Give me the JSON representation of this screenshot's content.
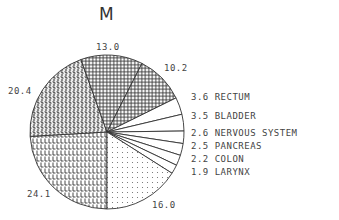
{
  "chart_data": {
    "type": "pie",
    "title": "M",
    "slices": [
      {
        "label": "",
        "value": 24.1,
        "pattern": "L"
      },
      {
        "label": "",
        "value": 20.4,
        "pattern": "S"
      },
      {
        "label": "",
        "value": 13.0,
        "pattern": "cross"
      },
      {
        "label": "",
        "value": 10.2,
        "pattern": "cross"
      },
      {
        "label": "RECTUM",
        "value": 3.6,
        "pattern": "none"
      },
      {
        "label": "BLADDER",
        "value": 3.5,
        "pattern": "none"
      },
      {
        "label": "NERVOUS SYSTEM",
        "value": 2.6,
        "pattern": "none"
      },
      {
        "label": "PANCREAS",
        "value": 2.5,
        "pattern": "none"
      },
      {
        "label": "COLON",
        "value": 2.2,
        "pattern": "none"
      },
      {
        "label": "LARYNX",
        "value": 1.9,
        "pattern": "none"
      },
      {
        "label": "",
        "value": 16.0,
        "pattern": "dots"
      }
    ],
    "start_angle_deg": 90,
    "direction": "clockwise"
  },
  "labels": {
    "title": "M",
    "v24": "24.1",
    "v20": "20.4",
    "v13": "13.0",
    "v10": "10.2",
    "v16": "16.0",
    "legend": [
      "3.6 RECTUM",
      "3.5 BLADDER",
      "2.6 NERVOUS SYSTEM",
      "2.5 PANCREAS",
      "2.2 COLON",
      "1.9 LARYNX"
    ]
  }
}
